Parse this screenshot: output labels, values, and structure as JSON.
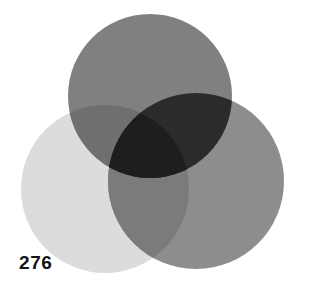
{
  "page": {
    "page_number": "276",
    "background_color": "#ffffff"
  },
  "figure": {
    "name": "three-circle-venn-diagram",
    "blend_mode": "multiply",
    "width": 310,
    "height": 296
  },
  "chart_data": {
    "type": "venn",
    "title": "",
    "subtitle": "",
    "xlabel": "",
    "ylabel": "",
    "grid": false,
    "legend_position": "none",
    "background_color": "#ffffff",
    "sets": [
      {
        "name": "top-circle",
        "label": "",
        "cx": 150,
        "cy": 96,
        "r": 82,
        "fill": "#808080",
        "opacity": 1.0
      },
      {
        "name": "right-circle",
        "label": "",
        "cx": 196,
        "cy": 181,
        "r": 88,
        "fill": "#8d8d8d",
        "opacity": 1.0
      },
      {
        "name": "bottom-left-circle",
        "label": "",
        "cx": 105,
        "cy": 189,
        "r": 84,
        "fill": "#dcdcdc",
        "opacity": 1.0
      }
    ],
    "region_colors": {
      "top_only": "#808080",
      "right_only": "#8d8d8d",
      "bottom_left_only": "#dcdcdc",
      "top_and_bottom_left": "#6f6f6f",
      "top_and_right": "#2b2b2b",
      "right_and_bottom_left": "#7b7b7b",
      "all_three": "#1e1e1e"
    },
    "annotations": [
      {
        "name": "page-number",
        "text": "276",
        "x": 19,
        "y": 265,
        "color": "#141414",
        "bold": true
      }
    ]
  }
}
